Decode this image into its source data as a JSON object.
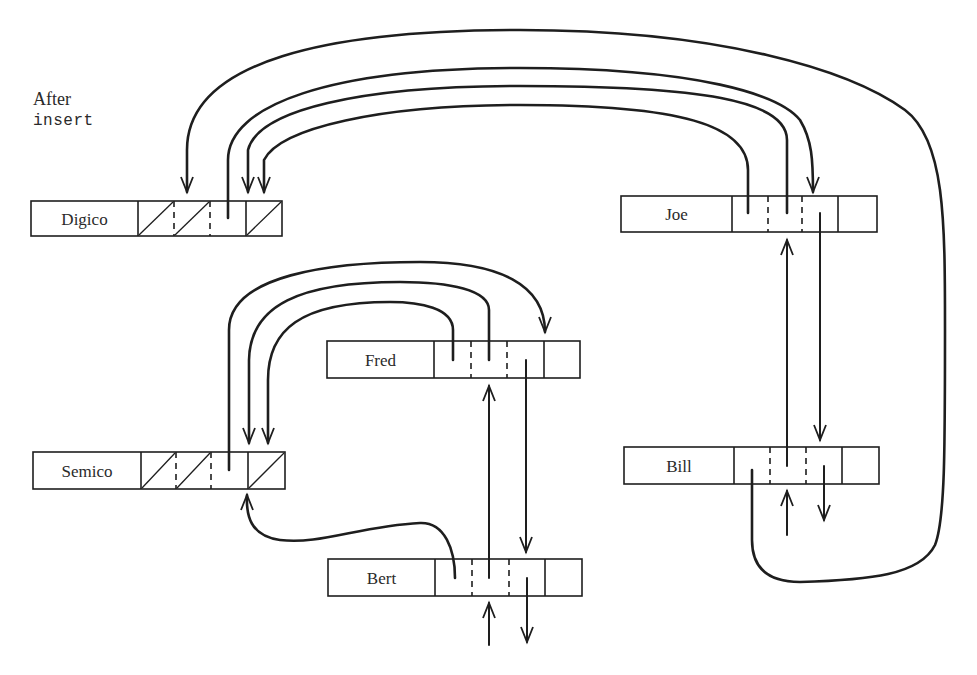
{
  "caption": {
    "line1": "After",
    "line2": "insert"
  },
  "colors": {
    "ink": "#1e1e1e",
    "background": "#ffffff"
  },
  "records": [
    {
      "id": "digico",
      "name": "Digico",
      "x": 31,
      "y": 201,
      "h": 35,
      "nameW": 107,
      "cells": [
        138,
        174,
        210,
        246,
        282
      ],
      "dashed": [
        1,
        2
      ],
      "slashed": [
        0,
        1,
        3
      ]
    },
    {
      "id": "joe",
      "name": "Joe",
      "x": 621,
      "y": 196,
      "h": 36,
      "nameW": 111,
      "cells": [
        732,
        768,
        802,
        838,
        877
      ],
      "dashed": [
        1,
        2
      ],
      "slashed": []
    },
    {
      "id": "fred",
      "name": "Fred",
      "x": 327,
      "y": 341,
      "h": 37,
      "nameW": 107,
      "cells": [
        434,
        471,
        507,
        544,
        580
      ],
      "dashed": [
        1,
        2
      ],
      "slashed": []
    },
    {
      "id": "semico",
      "name": "Semico",
      "x": 33,
      "y": 452,
      "h": 37,
      "nameW": 108,
      "cells": [
        141,
        176,
        211,
        248,
        285
      ],
      "dashed": [
        1,
        2
      ],
      "slashed": [
        0,
        1,
        3
      ]
    },
    {
      "id": "bill",
      "name": "Bill",
      "x": 624,
      "y": 447,
      "h": 37,
      "nameW": 110,
      "cells": [
        734,
        770,
        806,
        842,
        879
      ],
      "dashed": [
        1,
        2
      ],
      "slashed": []
    },
    {
      "id": "bert",
      "name": "Bert",
      "x": 328,
      "y": 559,
      "h": 37,
      "nameW": 107,
      "cells": [
        435,
        472,
        509,
        545,
        582
      ],
      "dashed": [
        1,
        2
      ],
      "slashed": []
    }
  ],
  "links": [
    {
      "id": "digico-outer-to-joe",
      "d": "M187 192 L187 150 C187 60 330 30 520 30 C720 30 850 70 905 110 C945 140 945 220 945 330 C945 450 945 520 935 545 C920 575 870 580 800 582 C760 582 752 560 752 540 L752 470",
      "arrowAt": "start",
      "arrowDir": "down",
      "heavy": true
    },
    {
      "id": "digico-ptr-joe",
      "d": "M228 218 L228 160 C228 105 330 68 520 68 C700 68 780 95 800 120 C812 140 813 160 813 192",
      "arrowAt": "end",
      "arrowDir": "down",
      "heavy": true
    },
    {
      "id": "joe-to-digico-1",
      "d": "M787 213 L787 140 C787 100 700 86 520 86 C360 86 258 110 248 150 L248 192",
      "arrowAt": "end",
      "arrowDir": "down",
      "heavy": true
    },
    {
      "id": "joe-to-digico-2",
      "d": "M748 213 L748 170 C748 125 680 105 520 105 C380 105 280 128 264 160 L264 192",
      "arrowAt": "end",
      "arrowDir": "down",
      "heavy": true
    },
    {
      "id": "joe-next-bill",
      "d": "M820 213 L820 440",
      "arrowAt": "end",
      "arrowDir": "down",
      "heavy": false
    },
    {
      "id": "bill-prev-joe",
      "d": "M787 466 L787 240",
      "arrowAt": "end",
      "arrowDir": "up",
      "heavy": false
    },
    {
      "id": "bill-next-out",
      "d": "M824 466 L824 520",
      "arrowAt": "end",
      "arrowDir": "down",
      "heavy": false
    },
    {
      "id": "bill-prev-in",
      "d": "M787 535 L787 491",
      "arrowAt": "end",
      "arrowDir": "up",
      "heavy": false
    },
    {
      "id": "semico-outer-to-fred",
      "d": "M229 470 L229 330 C229 275 330 262 420 262 C500 262 545 285 545 332",
      "arrowAt": "end",
      "arrowDir": "down",
      "heavy": true
    },
    {
      "id": "fred-to-semico-1",
      "d": "M489 360 L489 310 C489 290 450 282 400 282 C300 282 250 305 249 360 L249 443",
      "arrowAt": "end",
      "arrowDir": "down",
      "heavy": true
    },
    {
      "id": "fred-to-semico-2",
      "d": "M453 360 L453 330 C453 308 420 302 390 302 C300 302 268 330 268 380 L268 443",
      "arrowAt": "end",
      "arrowDir": "down",
      "heavy": true
    },
    {
      "id": "fred-next-bert",
      "d": "M526 360 L526 552",
      "arrowAt": "end",
      "arrowDir": "down",
      "heavy": false
    },
    {
      "id": "bert-prev-fred",
      "d": "M489 578 L489 386",
      "arrowAt": "end",
      "arrowDir": "up",
      "heavy": false
    },
    {
      "id": "bert-to-semico",
      "d": "M455 578 C455 550 445 522 420 523 C360 526 320 545 280 540 C250 536 246 515 247 495",
      "arrowAt": "end",
      "arrowDir": "up",
      "heavy": true
    },
    {
      "id": "bert-next-out",
      "d": "M527 578 L527 642",
      "arrowAt": "end",
      "arrowDir": "down",
      "heavy": false
    },
    {
      "id": "bert-prev-in",
      "d": "M489 645 L489 603",
      "arrowAt": "end",
      "arrowDir": "up",
      "heavy": false
    }
  ]
}
